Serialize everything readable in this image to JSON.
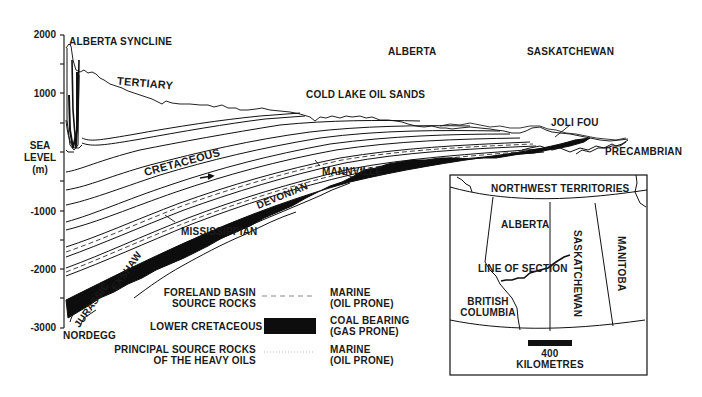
{
  "axis": {
    "ticks": [
      "2000",
      "1000",
      "-1000",
      "-2000",
      "-3000"
    ],
    "sea_level_label": [
      "SEA",
      "LEVEL",
      "(m)"
    ]
  },
  "section_labels": {
    "alberta_syncline": "ALBERTA SYNCLINE",
    "alberta": "ALBERTA",
    "saskatchewan": "SASKATCHEWAN",
    "tertiary": "TERTIARY",
    "cold_lake": "COLD LAKE OIL SANDS",
    "joli_fou": "JOLI FOU",
    "cretaceous": "CRETACEOUS",
    "precambrian": "PRECAMBRIAN",
    "mannville": "MANNVILLE",
    "devonian": "DEVONIAN",
    "mississippian": "MISSISSIPPIAN",
    "exshaw": "EXSHAW",
    "jurassic": "JURASSIC",
    "nordegg": "NORDEGG"
  },
  "legend": {
    "items": [
      {
        "left": [
          "FORELAND BASIN",
          "SOURCE ROCKS"
        ],
        "symbol": "dashed-line",
        "right": [
          "MARINE",
          "(OIL PRONE)"
        ]
      },
      {
        "left": [
          "LOWER CRETACEOUS"
        ],
        "symbol": "black-fill",
        "right": [
          "COAL BEARING",
          "(GAS PRONE)"
        ]
      },
      {
        "left": [
          "PRINCIPAL SOURCE ROCKS",
          "OF THE HEAVY OILS"
        ],
        "symbol": "dotted-line",
        "right": [
          "MARINE",
          "(OIL PRONE)"
        ]
      }
    ]
  },
  "inset_map": {
    "regions": {
      "nwt": "NORTHWEST TERRITORIES",
      "alberta": "ALBERTA",
      "saskatchewan": "SASKATCHEWAN",
      "manitoba": "MANITOBA",
      "bc": [
        "BRITISH",
        "COLUMBIA"
      ]
    },
    "line_label": "LINE OF SECTION",
    "scale_value": "400",
    "scale_unit": "KILOMETRES"
  },
  "colors": {
    "ink": "#111111",
    "paper": "#ffffff"
  }
}
